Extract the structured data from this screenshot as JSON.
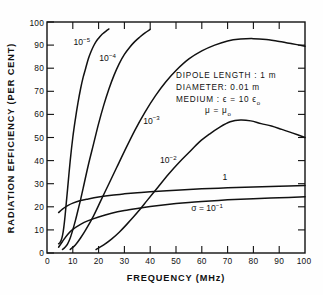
{
  "figure": {
    "background_color": "#fefefe",
    "line_color": "#111111"
  },
  "chart_data": {
    "type": "line",
    "title": "",
    "xlabel": "FREQUENCY  (MHz)",
    "ylabel": "RADIATION EFFICIENCY (PER CENT)",
    "xlim": [
      0,
      100
    ],
    "ylim": [
      0,
      100
    ],
    "xticks": [
      0,
      10,
      20,
      30,
      40,
      50,
      60,
      70,
      80,
      90,
      100
    ],
    "yticks": [
      0,
      10,
      20,
      30,
      40,
      50,
      60,
      70,
      80,
      90,
      100
    ],
    "xtick_labels": [
      "0",
      "10",
      "20",
      "30",
      "40",
      "50",
      "60",
      "70",
      "80",
      "90",
      "100"
    ],
    "ytick_labels": [
      "0",
      "10",
      "20",
      "30",
      "40",
      "50",
      "60",
      "70",
      "80",
      "90",
      "100"
    ],
    "grid": false,
    "legend_position": "inline-curve-labels",
    "series": [
      {
        "name": "sigma = 10^-5",
        "label_base": "10",
        "label_exponent": "−5",
        "label_x": 13.5,
        "label_y": 90,
        "x": [
          4.5,
          5,
          5.5,
          6,
          6.5,
          7,
          7.5,
          8,
          9,
          10,
          11,
          12,
          13,
          14,
          15,
          16,
          17,
          18,
          19,
          20,
          21,
          22,
          23,
          24
        ],
        "y": [
          4,
          4.5,
          5.5,
          7.5,
          11,
          16,
          22,
          28,
          40,
          50,
          58,
          65,
          71,
          76,
          80,
          84,
          87,
          89.5,
          91.5,
          93,
          94.3,
          95.3,
          96.2,
          97
        ]
      },
      {
        "name": "sigma = 10^-4",
        "label_base": "10",
        "label_exponent": "−4",
        "label_x": 23.5,
        "label_y": 83,
        "x": [
          6,
          7,
          8,
          9,
          10,
          11,
          12,
          13,
          14,
          16,
          18,
          20,
          22,
          24,
          26,
          28,
          30,
          32,
          34,
          36,
          38,
          40
        ],
        "y": [
          1.5,
          2.5,
          4,
          6.5,
          10,
          14,
          18.5,
          23,
          28,
          38,
          47,
          56,
          64,
          71,
          77,
          82,
          86,
          89,
          91.5,
          93.5,
          95.3,
          96.8
        ]
      },
      {
        "name": "sigma = 10^-3",
        "label_base": "10",
        "label_exponent": "−3",
        "label_x": 40.5,
        "label_y": 56,
        "x": [
          9,
          11,
          13,
          15,
          18,
          21,
          24,
          27,
          30,
          34,
          38,
          42,
          46,
          50,
          55,
          60,
          65,
          70,
          75,
          80,
          85,
          90,
          95,
          100
        ],
        "y": [
          1.5,
          3.5,
          6.5,
          10,
          16,
          23,
          30,
          37,
          44,
          53,
          61,
          68,
          74,
          79,
          84,
          87.5,
          90,
          91.8,
          92.6,
          92.8,
          92.4,
          91.6,
          90.6,
          89.5
        ]
      },
      {
        "name": "sigma = 10^-2",
        "label_base": "10",
        "label_exponent": "−2",
        "label_x": 47,
        "label_y": 39,
        "x": [
          19,
          22,
          25,
          28,
          31,
          35,
          39,
          43,
          47,
          51,
          55,
          59,
          63,
          67,
          71,
          75,
          79,
          83,
          87,
          91,
          95,
          100
        ],
        "y": [
          1.5,
          3.5,
          6,
          9,
          12.5,
          17.5,
          23,
          28.5,
          34,
          39,
          43.5,
          48,
          51.5,
          54.5,
          56.8,
          57.6,
          57.2,
          56,
          55,
          53.5,
          52,
          50
        ]
      },
      {
        "name": "sigma = 1",
        "label_base": "1",
        "label_exponent": "",
        "label_x": 69,
        "label_y": 31.5,
        "x": [
          4.5,
          6,
          8,
          10,
          13,
          16,
          20,
          25,
          30,
          35,
          40,
          50,
          60,
          70,
          80,
          90,
          100
        ],
        "y": [
          17.5,
          19,
          20.5,
          21.6,
          22.7,
          23.4,
          24.2,
          25,
          25.6,
          26.1,
          26.5,
          27.2,
          27.8,
          28.2,
          28.6,
          28.9,
          29.2
        ]
      },
      {
        "name": "sigma = 10^-1",
        "label_prefix": "σ = ",
        "label_base": "10",
        "label_exponent": "−1",
        "label_x": 62,
        "label_y": 18,
        "x": [
          4.5,
          6,
          8,
          10,
          13,
          16,
          20,
          25,
          30,
          35,
          40,
          45,
          50,
          55,
          60,
          70,
          80,
          90,
          100
        ],
        "y": [
          2.5,
          5,
          8,
          10.2,
          12.4,
          14,
          15.6,
          17.2,
          18.4,
          19.3,
          20.1,
          20.8,
          21.4,
          21.9,
          22.3,
          23,
          23.5,
          23.9,
          24.3
        ]
      }
    ],
    "annotations": [
      {
        "id": "dipole-length",
        "text": "DIPOLE LENGTH : 1 m",
        "x": 50,
        "y": 80
      },
      {
        "id": "diameter",
        "text": "DIAMETER: 0.01 m",
        "x": 50,
        "y": 74.5
      },
      {
        "id": "medium-epsilon",
        "text": "MEDIUM :  ϵ = 10 ϵ",
        "subscript": "o",
        "x": 50,
        "y": 69
      },
      {
        "id": "medium-mu",
        "text": "μ = μ",
        "subscript": "o",
        "x": 50,
        "y": 63.5
      }
    ]
  }
}
